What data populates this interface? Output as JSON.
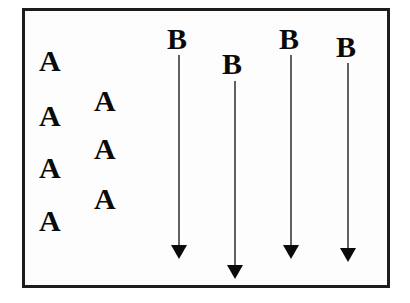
{
  "figure": {
    "background_color": "#ffffff",
    "frame": {
      "name": "diagram-frame",
      "border_color": "#1d1d1d",
      "border_width_px": 3,
      "fill_color": "#fdfdfd",
      "x": 22,
      "y": 8,
      "width": 368,
      "height": 280
    },
    "glyph_color": "#0a0a0a",
    "arrow_color": "#3a3a3a"
  },
  "a_labels": [
    {
      "text": "A",
      "x": 39,
      "y": 46,
      "column": "left",
      "index": 1
    },
    {
      "text": "A",
      "x": 94,
      "y": 86,
      "column": "right",
      "index": 1
    },
    {
      "text": "A",
      "x": 39,
      "y": 101,
      "column": "left",
      "index": 2
    },
    {
      "text": "A",
      "x": 94,
      "y": 134,
      "column": "right",
      "index": 2
    },
    {
      "text": "A",
      "x": 39,
      "y": 153,
      "column": "left",
      "index": 3
    },
    {
      "text": "A",
      "x": 94,
      "y": 184,
      "column": "right",
      "index": 3
    },
    {
      "text": "A",
      "x": 39,
      "y": 206,
      "column": "left",
      "index": 4
    }
  ],
  "b_labels": [
    {
      "text": "B",
      "x": 167,
      "y": 24,
      "index": 1
    },
    {
      "text": "B",
      "x": 222,
      "y": 49,
      "index": 2
    },
    {
      "text": "B",
      "x": 279,
      "y": 24,
      "index": 3
    },
    {
      "text": "B",
      "x": 336,
      "y": 32,
      "index": 4
    }
  ],
  "arrows": [
    {
      "name": "arrow-1",
      "x": 179,
      "y_start": 55,
      "y_end": 259,
      "index": 1
    },
    {
      "name": "arrow-2",
      "x": 235,
      "y_start": 81,
      "y_end": 279,
      "index": 2
    },
    {
      "name": "arrow-3",
      "x": 291,
      "y_start": 55,
      "y_end": 259,
      "index": 3
    },
    {
      "name": "arrow-4",
      "x": 348,
      "y_start": 63,
      "y_end": 262,
      "index": 4
    }
  ]
}
